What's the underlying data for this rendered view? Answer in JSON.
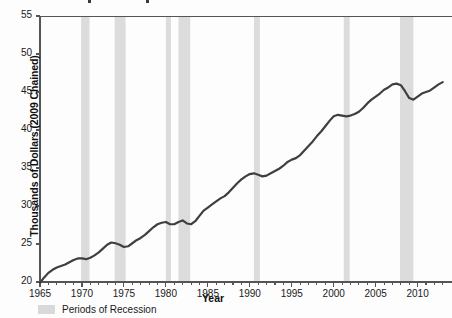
{
  "chart_data": {
    "type": "line",
    "title": "",
    "xlabel": "Year",
    "ylabel": "Thousands of Dollars (2009 Chained)",
    "xlim": [
      1965,
      2013.5
    ],
    "ylim": [
      20,
      55
    ],
    "yticks": [
      20,
      25,
      30,
      35,
      40,
      45,
      50,
      55
    ],
    "xticks": [
      1965,
      1970,
      1975,
      1980,
      1985,
      1990,
      1995,
      2000,
      2005,
      2010
    ],
    "xtick_labels": [
      "1965",
      "1970",
      "1975",
      "1980",
      "1985",
      "1990",
      "1995",
      "2000",
      "2005",
      "2010"
    ],
    "ytick_labels": [
      "20",
      "25",
      "30",
      "35",
      "40",
      "45",
      "50",
      "55"
    ],
    "grid": false,
    "legend_position": "below-left",
    "line_color": "#3f3f3f",
    "band_color": "#dcdcdc",
    "axis_color": "#555555",
    "legend": [
      {
        "label": "Periods of Recession",
        "color": "#d9d9d9",
        "type": "band"
      }
    ],
    "series": [
      {
        "name": "Real GDP per capita",
        "color": "#3f3f3f",
        "x": [
          1965,
          1965.5,
          1966,
          1966.5,
          1967,
          1967.5,
          1968,
          1968.5,
          1969,
          1969.5,
          1970,
          1970.5,
          1971,
          1971.5,
          1972,
          1972.5,
          1973,
          1973.5,
          1974,
          1974.5,
          1975,
          1975.5,
          1976,
          1976.5,
          1977,
          1977.5,
          1978,
          1978.5,
          1979,
          1979.5,
          1980,
          1980.5,
          1981,
          1981.5,
          1982,
          1982.5,
          1983,
          1983.5,
          1984,
          1984.5,
          1985,
          1985.5,
          1986,
          1986.5,
          1987,
          1987.5,
          1988,
          1988.5,
          1989,
          1989.5,
          1990,
          1990.5,
          1991,
          1991.5,
          1992,
          1992.5,
          1993,
          1993.5,
          1994,
          1994.5,
          1995,
          1995.5,
          1996,
          1996.5,
          1997,
          1997.5,
          1998,
          1998.5,
          1999,
          1999.5,
          2000,
          2000.5,
          2001,
          2001.5,
          2002,
          2002.5,
          2003,
          2003.5,
          2004,
          2004.5,
          2005,
          2005.5,
          2006,
          2006.5,
          2007,
          2007.5,
          2008,
          2008.5,
          2009,
          2009.5,
          2010,
          2010.5,
          2011,
          2011.5,
          2012,
          2012.5,
          2013
        ],
        "y": [
          19.9,
          20.6,
          21.2,
          21.6,
          21.9,
          22.1,
          22.3,
          22.6,
          22.9,
          23.1,
          23.1,
          23.0,
          23.2,
          23.5,
          23.9,
          24.4,
          24.9,
          25.2,
          25.1,
          24.9,
          24.6,
          24.7,
          25.1,
          25.5,
          25.8,
          26.2,
          26.7,
          27.2,
          27.6,
          27.8,
          27.9,
          27.6,
          27.6,
          27.9,
          28.1,
          27.7,
          27.6,
          28.0,
          28.7,
          29.4,
          29.8,
          30.2,
          30.6,
          31.0,
          31.3,
          31.8,
          32.4,
          33.0,
          33.5,
          33.9,
          34.2,
          34.3,
          34.1,
          33.9,
          34.0,
          34.3,
          34.6,
          34.9,
          35.3,
          35.8,
          36.1,
          36.3,
          36.7,
          37.3,
          37.9,
          38.5,
          39.2,
          39.8,
          40.5,
          41.2,
          41.8,
          42.0,
          41.9,
          41.8,
          41.9,
          42.1,
          42.4,
          42.9,
          43.5,
          44.0,
          44.4,
          44.8,
          45.3,
          45.6,
          46.0,
          46.1,
          45.9,
          45.1,
          44.2,
          44.0,
          44.4,
          44.8,
          45.0,
          45.2,
          45.6,
          46.0,
          46.3
        ]
      }
    ],
    "recession_bands": [
      {
        "start": 1969.9,
        "end": 1970.9
      },
      {
        "start": 1973.9,
        "end": 1975.2
      },
      {
        "start": 1980.0,
        "end": 1980.6
      },
      {
        "start": 1981.5,
        "end": 1982.9
      },
      {
        "start": 1990.5,
        "end": 1991.2
      },
      {
        "start": 2001.2,
        "end": 2001.9
      },
      {
        "start": 2007.9,
        "end": 2009.5
      }
    ]
  }
}
